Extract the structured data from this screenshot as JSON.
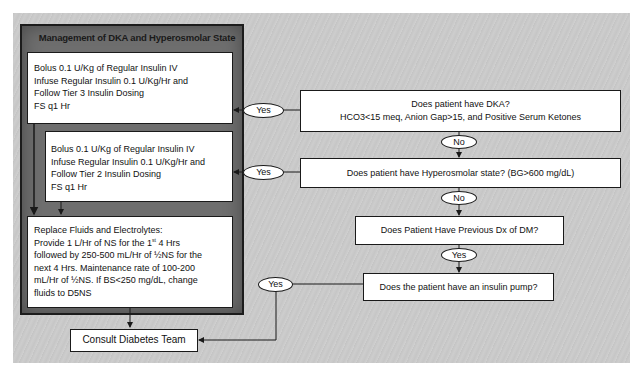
{
  "panel": {
    "title": "Management of DKA and Hyperosmolar State"
  },
  "left_boxes": {
    "tier3": {
      "lines": [
        "Bolus 0.1 U/Kg of Regular Insulin IV",
        "Infuse Regular Insulin 0.1 U/Kg/Hr and",
        "Follow Tier 3 Insulin Dosing",
        "FS q1 Hr"
      ]
    },
    "tier2": {
      "lines": [
        "Bolus 0.1 U/Kg of Regular Insulin IV",
        "Infuse Regular Insulin 0.1 U/Kg/Hr and",
        "Follow Tier 2 Insulin Dosing",
        "FS q1 Hr"
      ]
    },
    "fluids": {
      "line1": "Replace Fluids and Electrolytes:",
      "line2_pre": "Provide 1 L/Hr of NS for the 1",
      "line2_sup": "st",
      "line2_post": " 4 Hrs",
      "line3": "followed by 250-500 mL/Hr of ½NS for the",
      "line4": "next 4 Hrs. Maintenance rate of 100-200",
      "line5": "mL/Hr of ½NS. If BS<250 mg/dL, change",
      "line6": "fluids to D5NS"
    },
    "consult": {
      "label": "Consult Diabetes Team"
    }
  },
  "questions": {
    "dka": {
      "line1": "Does patient have DKA?",
      "line2": "HCO3<15 meq, Anion Gap>15, and Positive Serum Ketones"
    },
    "hyperosmolar": {
      "label": "Does patient have Hyperosmolar state? (BG>600 mg/dL)"
    },
    "previous_dx": {
      "label": "Does Patient Have Previous Dx of DM?"
    },
    "insulin_pump": {
      "label": "Does the patient have an insulin pump?"
    }
  },
  "connectors": {
    "yes_dka": "Yes",
    "yes_hyperosmolar": "Yes",
    "yes_pump": "Yes",
    "no_dka": "No",
    "no_hyperosmolar": "No",
    "yes_previous_dx": "Yes"
  },
  "colors": {
    "background": "#c8c8c8",
    "panel": "#6e6e6e",
    "box_fill": "#ffffff",
    "border": "#1a1a1a"
  }
}
